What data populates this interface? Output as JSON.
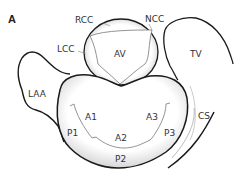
{
  "figure": {
    "panel_label": "A",
    "labels": {
      "rcc": "RCC",
      "ncc": "NCC",
      "lcc": "LCC",
      "av": "AV",
      "tv": "TV",
      "laa": "LAA",
      "cs": "CS",
      "a1": "A1",
      "a2": "A2",
      "a3": "A3",
      "p1": "P1",
      "p2": "P2",
      "p3": "P3"
    },
    "colors": {
      "outline": "#1a1a1a",
      "leader": "#888888",
      "text": "#333333",
      "shade": "#d8d8d8"
    }
  }
}
